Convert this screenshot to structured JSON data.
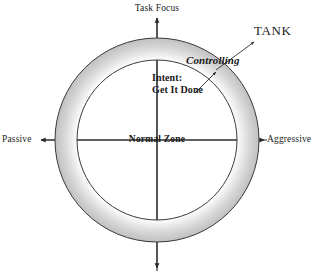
{
  "diagram": {
    "canvas": {
      "width": 327,
      "height": 273,
      "background": "#ffffff"
    },
    "axes": {
      "vertical": {
        "top_label": "Task Focus",
        "bottom_label": "",
        "top_arrow": "arrow-up",
        "bottom_arrow": "arrow-down"
      },
      "horizontal": {
        "left_label": "Passive",
        "right_label": "Aggressive",
        "left_arrow": "arrow-left",
        "right_arrow": "arrow-right"
      }
    },
    "ring": {
      "center_label": "Normal Zone",
      "center_x": 157,
      "center_y": 140,
      "outer_radius": 102,
      "inner_radius": 80,
      "fill_inner": "#ffffff",
      "fill_outer": "#c9c9c9",
      "stroke": "#3a3a3a"
    },
    "annotations": {
      "zone_style": "Controlling",
      "intent_line1": "Intent:",
      "intent_line2": "Get It Done",
      "callout": "TANK"
    }
  },
  "colors": {
    "text": "#1a1a1a",
    "line": "#2b2b2b",
    "ring_light": "#ffffff",
    "ring_mid": "#e6e6e6",
    "ring_dark": "#c2c2c2",
    "ring_outline": "#3a3a3a"
  }
}
